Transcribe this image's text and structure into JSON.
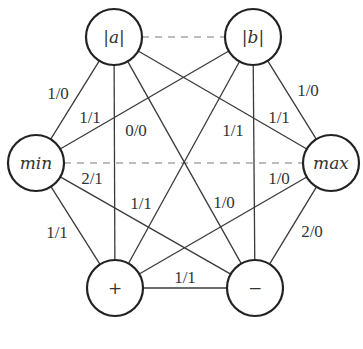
{
  "nodes": {
    "a": {
      "label": "|a|",
      "x": 114,
      "y": 37,
      "italic": true
    },
    "b": {
      "label": "|b|",
      "x": 253,
      "y": 37,
      "italic": true
    },
    "min": {
      "label": "min",
      "x": 36,
      "y": 163,
      "italic": true
    },
    "max": {
      "label": "max",
      "x": 331,
      "y": 163,
      "italic": true
    },
    "plus": {
      "label": "+",
      "x": 115,
      "y": 288,
      "italic": false
    },
    "minus": {
      "label": "−",
      "x": 255,
      "y": 288,
      "italic": false
    }
  },
  "edges": [
    {
      "from": "a",
      "to": "min",
      "label": "1/0",
      "lx": 58,
      "ly": 93
    },
    {
      "from": "b",
      "to": "min",
      "label": "1/1",
      "lx": 90,
      "ly": 117
    },
    {
      "from": "a",
      "to": "plus",
      "label": "0/0",
      "lx": 136,
      "ly": 130
    },
    {
      "from": "b",
      "to": "minus",
      "label": "1/1",
      "lx": 233,
      "ly": 130
    },
    {
      "from": "a",
      "to": "max",
      "label": "1/1",
      "lx": 279,
      "ly": 117
    },
    {
      "from": "b",
      "to": "max",
      "label": "1/0",
      "lx": 308,
      "ly": 90
    },
    {
      "from": "min",
      "to": "minus",
      "label": "2/1",
      "lx": 92,
      "ly": 178
    },
    {
      "from": "b",
      "to": "plus",
      "label": "1/1",
      "lx": 141,
      "ly": 203
    },
    {
      "from": "a",
      "to": "minus",
      "label": "1/0",
      "lx": 224,
      "ly": 202
    },
    {
      "from": "max",
      "to": "plus",
      "label": "1/0",
      "lx": 279,
      "ly": 178
    },
    {
      "from": "min",
      "to": "plus",
      "label": "1/1",
      "lx": 57,
      "ly": 232
    },
    {
      "from": "max",
      "to": "minus",
      "label": "2/0",
      "lx": 312,
      "ly": 231
    },
    {
      "from": "plus",
      "to": "minus",
      "label": "1/1",
      "lx": 185,
      "ly": 277
    }
  ],
  "dashed_edges": [
    {
      "from": "a",
      "to": "b"
    },
    {
      "from": "min",
      "to": "max"
    }
  ],
  "style": {
    "edge_color": "#3a3a3a",
    "dashed_color": "#a8a8a8",
    "node_stroke": "#222222",
    "node_radius": 28
  }
}
